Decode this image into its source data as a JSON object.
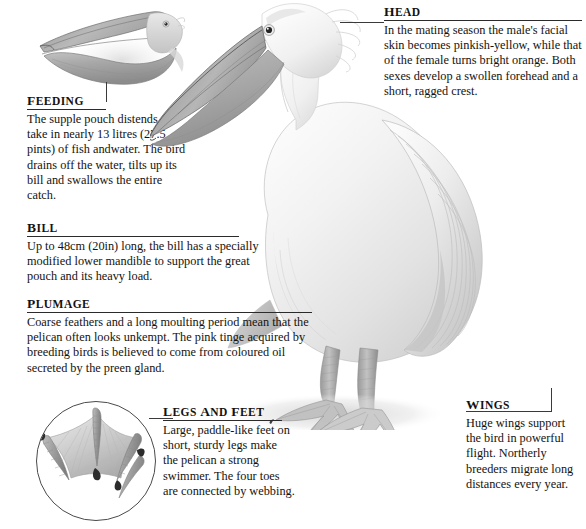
{
  "page": {
    "background_color": "#ffffff",
    "ink_color": "#15130f",
    "rule_color": "#2b2b2b",
    "illustration_style": "grayscale pencil illustration"
  },
  "callouts": [
    {
      "id": "feeding",
      "heading": "Feeding",
      "body": "The supple pouch distends to take in nearly 13 litres (27.5 pints) of fish andwater. The bird drains off the water, tilts up its bill and swallows the entire catch."
    },
    {
      "id": "head",
      "heading": "Head",
      "body": "In the mating season the male's facial skin becomes pinkish-yellow, while that of the female turns bright orange. Both sexes develop a swollen forehead and a short, ragged crest."
    },
    {
      "id": "bill",
      "heading": "Bill",
      "body": "Up to 48cm (20in) long, the bill has a specially modified lower mandible to support the great pouch and its heavy load."
    },
    {
      "id": "plumage",
      "heading": "Plumage",
      "body": "Coarse feathers and a long moulting period mean that the pelican often looks unkempt. The pink tinge acquired by breeding birds is believed to come from coloured oil secreted by the preen gland."
    },
    {
      "id": "legs-and-feet",
      "heading": "Legs and feet",
      "body": "Large, paddle-like feet on short, sturdy legs make the pelican a strong swimmer. The four toes are connected by webbing."
    },
    {
      "id": "wings",
      "heading": "Wings",
      "body": "Huge wings support the bird in powerful flight. Northerly breeders migrate long distances every year."
    }
  ],
  "illustrations": [
    {
      "id": "feeding-inset",
      "name": "pelican-head-open-pouch-illustration"
    },
    {
      "id": "main-pelican",
      "name": "standing-pelican-illustration"
    },
    {
      "id": "foot-inset",
      "name": "webbed-foot-circle-illustration"
    }
  ]
}
